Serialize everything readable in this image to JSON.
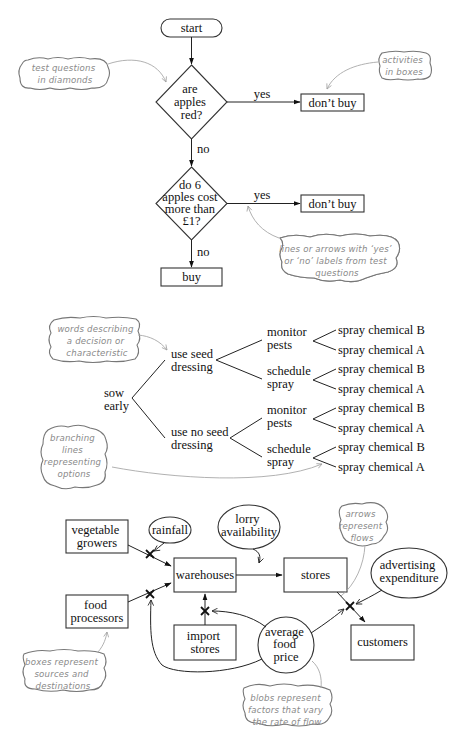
{
  "flowchart": {
    "start": "start",
    "q1": [
      "are",
      "apples",
      "red?"
    ],
    "q1_yes_label": "yes",
    "q1_no_label": "no",
    "q1_yes_action": "don’t buy",
    "q2": [
      "do 6",
      "apples cost",
      "more than",
      "£1?"
    ],
    "q2_yes_label": "yes",
    "q2_no_label": "no",
    "q2_yes_action": "don’t buy",
    "q2_no_action": "buy",
    "notes": {
      "diamonds": [
        "test questions",
        "in diamonds"
      ],
      "boxes": [
        "activities",
        "in boxes"
      ],
      "arrows": [
        "lines or arrows with ‘yes’",
        "or ‘no’ labels from test",
        "questions"
      ]
    }
  },
  "tree": {
    "root": [
      "sow",
      "early"
    ],
    "level1": [
      [
        "use seed",
        "dressing"
      ],
      [
        "use no seed",
        "dressing"
      ]
    ],
    "level2": [
      [
        "monitor",
        "pests"
      ],
      [
        "schedule",
        "spray"
      ],
      [
        "monitor",
        "pests"
      ],
      [
        "schedule",
        "spray"
      ]
    ],
    "leaves": [
      "spray chemical B",
      "spray chemical A",
      "spray chemical B",
      "spray chemical A",
      "spray chemical B",
      "spray chemical A",
      "spray chemical B",
      "spray chemical A"
    ],
    "notes": {
      "words": [
        "words describing",
        "a decision or",
        "characteristic"
      ],
      "branching": [
        "branching",
        "lines",
        "representing",
        "options"
      ]
    }
  },
  "flow": {
    "vegetable_growers": [
      "vegetable",
      "growers"
    ],
    "food_processors": [
      "food",
      "processors"
    ],
    "warehouses": "warehouses",
    "import_stores": [
      "import",
      "stores"
    ],
    "stores": "stores",
    "customers": "customers",
    "rainfall": "rainfall",
    "lorry": [
      "lorry",
      "availability"
    ],
    "advertising": [
      "advertising",
      "expenditure"
    ],
    "price": [
      "average",
      "food",
      "price"
    ],
    "notes": {
      "arrows": [
        "arrows",
        "represent",
        "flows"
      ],
      "boxes": [
        "boxes represent",
        "sources and",
        "destinations"
      ],
      "blobs": [
        "blobs represent",
        "factors that vary",
        "the rate of flow"
      ]
    }
  }
}
